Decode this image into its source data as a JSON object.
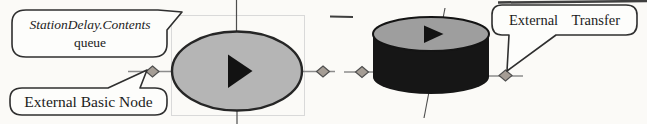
{
  "figure": {
    "name": "simulation-model-annotated-diagram",
    "background": "#fbfaf7"
  },
  "callouts": {
    "queue": {
      "line1": "StationDelay.Contents",
      "line2": "queue"
    },
    "basic_node": {
      "label": "External Basic Node"
    },
    "transfer": {
      "word1": "External",
      "word2": "Transfer"
    }
  },
  "colors": {
    "ellipse_fill": "#b5b5b5",
    "ellipse_stroke": "#262626",
    "triangle": "#121212",
    "cylinder_top_fill": "#9e9e9e",
    "cylinder_top_stroke": "#141414",
    "cylinder_body": "#161616",
    "diamond_fill": "#a59d95",
    "diamond_stroke": "#4f4f4f",
    "connector": "#8c8c8c",
    "crosshair": "#4d4d4d",
    "grid": "#d9d9d9",
    "callout_fill": "#fdfdfb",
    "callout_stroke": "#2f2f2f",
    "artifact": "#3f3f3f",
    "text": "#1c1c1c"
  }
}
